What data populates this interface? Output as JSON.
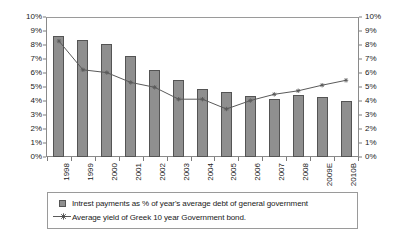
{
  "chart_data": {
    "type": "bar",
    "title": "",
    "subtitle": "",
    "xlabel": "",
    "ylabel": "",
    "ylim": [
      0,
      10
    ],
    "y2lim": [
      0,
      10
    ],
    "ytick_labels": [
      "10%",
      "9%",
      "8%",
      "7%",
      "6%",
      "5%",
      "4%",
      "3%",
      "2%",
      "1%",
      "0%"
    ],
    "ytick_values": [
      10,
      9,
      8,
      7,
      6,
      5,
      4,
      3,
      2,
      1,
      0
    ],
    "y2tick_labels": [
      "10%",
      "9%",
      "8%",
      "7%",
      "6%",
      "5%",
      "4%",
      "3%",
      "2%",
      "1%",
      "0%"
    ],
    "grid": false,
    "legend_position": "bottom",
    "categories": [
      "1998",
      "1999",
      "2000",
      "2001",
      "2002",
      "2003",
      "2004",
      "2005",
      "2006",
      "2007",
      "2008",
      "2009E",
      "2010B"
    ],
    "series": [
      {
        "name": "Intrest payments as % of year's average debt of general government",
        "type": "bar",
        "axis": "left",
        "color": "#8f8f8f",
        "values": [
          8.7,
          8.45,
          8.15,
          7.3,
          6.3,
          5.6,
          4.95,
          4.75,
          4.4,
          4.2,
          4.5,
          4.35,
          4.1
        ]
      },
      {
        "name": "Average yield of Greek 10 year Government bond.",
        "type": "line",
        "axis": "right",
        "color": "#5a5a5a",
        "values": [
          8.35,
          6.3,
          6.1,
          5.4,
          5.05,
          4.2,
          4.2,
          3.5,
          4.1,
          4.55,
          4.8,
          5.2,
          5.55
        ]
      }
    ],
    "legend": [
      {
        "label": "Intrest payments as % of year's average debt of general government",
        "marker": "square-swatch"
      },
      {
        "label": "Average yield of Greek 10 year Government bond.",
        "marker": "line-with-star"
      }
    ]
  }
}
